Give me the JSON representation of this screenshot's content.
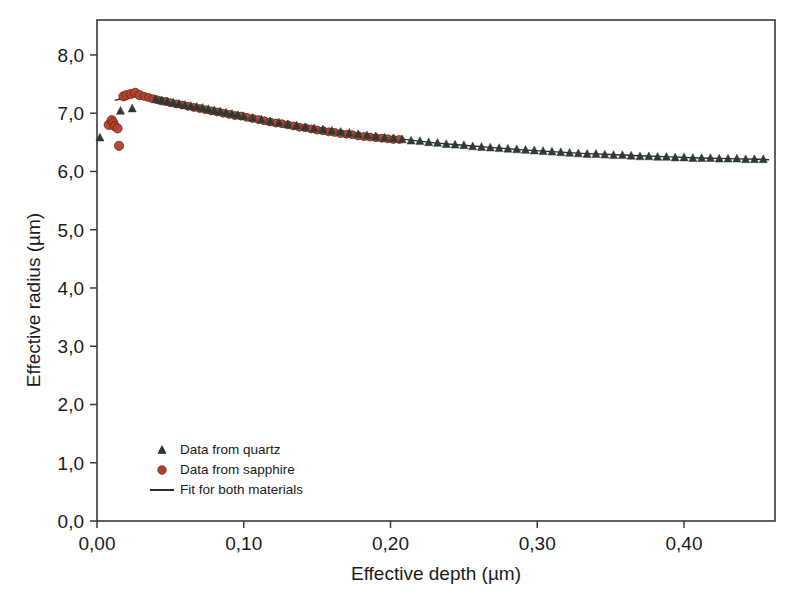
{
  "figure": {
    "background_color": "#ffffff",
    "frame_color": "#3a3a3a"
  },
  "chart_data": {
    "type": "scatter",
    "title": "",
    "xlabel": "Effective depth (µm)",
    "ylabel": "Effective radius (µm)",
    "xlim": [
      0.0,
      0.462
    ],
    "ylim": [
      0.0,
      8.6
    ],
    "xticks": [
      0.0,
      0.1,
      0.2,
      0.3,
      0.4
    ],
    "xtick_labels": [
      "0,00",
      "0,10",
      "0,20",
      "0,30",
      "0,40"
    ],
    "yticks": [
      0.0,
      1.0,
      2.0,
      3.0,
      4.0,
      5.0,
      6.0,
      7.0,
      8.0
    ],
    "ytick_labels": [
      "0,0",
      "1,0",
      "2,0",
      "3,0",
      "4,0",
      "5,0",
      "6,0",
      "7,0",
      "8,0"
    ],
    "grid": false,
    "legend_position": "lower-left",
    "decimal_separator": ",",
    "series": [
      {
        "name": "Data from quartz",
        "marker": "triangle",
        "color": "#2f3a32",
        "points": [
          [
            0.002,
            6.58
          ],
          [
            0.016,
            7.04
          ],
          [
            0.024,
            7.08
          ],
          [
            0.04,
            7.24
          ],
          [
            0.044,
            7.22
          ],
          [
            0.048,
            7.2
          ],
          [
            0.052,
            7.18
          ],
          [
            0.056,
            7.16
          ],
          [
            0.06,
            7.14
          ],
          [
            0.064,
            7.12
          ],
          [
            0.068,
            7.11
          ],
          [
            0.072,
            7.09
          ],
          [
            0.076,
            7.07
          ],
          [
            0.08,
            7.05
          ],
          [
            0.084,
            7.03
          ],
          [
            0.088,
            7.01
          ],
          [
            0.092,
            6.99
          ],
          [
            0.096,
            6.97
          ],
          [
            0.1,
            6.95
          ],
          [
            0.106,
            6.92
          ],
          [
            0.112,
            6.89
          ],
          [
            0.118,
            6.86
          ],
          [
            0.124,
            6.84
          ],
          [
            0.13,
            6.81
          ],
          [
            0.136,
            6.79
          ],
          [
            0.142,
            6.76
          ],
          [
            0.148,
            6.74
          ],
          [
            0.154,
            6.72
          ],
          [
            0.16,
            6.7
          ],
          [
            0.166,
            6.68
          ],
          [
            0.172,
            6.66
          ],
          [
            0.178,
            6.64
          ],
          [
            0.184,
            6.62
          ],
          [
            0.19,
            6.6
          ],
          [
            0.196,
            6.58
          ],
          [
            0.202,
            6.57
          ],
          [
            0.208,
            6.55
          ],
          [
            0.214,
            6.53
          ],
          [
            0.22,
            6.52
          ],
          [
            0.226,
            6.5
          ],
          [
            0.232,
            6.49
          ],
          [
            0.238,
            6.47
          ],
          [
            0.244,
            6.46
          ],
          [
            0.25,
            6.45
          ],
          [
            0.256,
            6.43
          ],
          [
            0.262,
            6.42
          ],
          [
            0.268,
            6.41
          ],
          [
            0.274,
            6.4
          ],
          [
            0.28,
            6.39
          ],
          [
            0.286,
            6.38
          ],
          [
            0.292,
            6.37
          ],
          [
            0.298,
            6.36
          ],
          [
            0.304,
            6.35
          ],
          [
            0.31,
            6.34
          ],
          [
            0.316,
            6.33
          ],
          [
            0.322,
            6.32
          ],
          [
            0.328,
            6.31
          ],
          [
            0.334,
            6.3
          ],
          [
            0.34,
            6.3
          ],
          [
            0.346,
            6.29
          ],
          [
            0.352,
            6.28
          ],
          [
            0.358,
            6.28
          ],
          [
            0.364,
            6.27
          ],
          [
            0.37,
            6.26
          ],
          [
            0.376,
            6.26
          ],
          [
            0.382,
            6.25
          ],
          [
            0.388,
            6.25
          ],
          [
            0.394,
            6.24
          ],
          [
            0.4,
            6.24
          ],
          [
            0.406,
            6.23
          ],
          [
            0.412,
            6.23
          ],
          [
            0.418,
            6.23
          ],
          [
            0.424,
            6.22
          ],
          [
            0.43,
            6.22
          ],
          [
            0.436,
            6.22
          ],
          [
            0.442,
            6.21
          ],
          [
            0.448,
            6.21
          ],
          [
            0.454,
            6.21
          ]
        ]
      },
      {
        "name": "Data from sapphire",
        "marker": "circle",
        "color": "#b1402c",
        "points": [
          [
            0.008,
            6.8
          ],
          [
            0.01,
            6.88
          ],
          [
            0.011,
            6.84
          ],
          [
            0.012,
            6.78
          ],
          [
            0.014,
            6.74
          ],
          [
            0.015,
            6.44
          ],
          [
            0.018,
            7.29
          ],
          [
            0.02,
            7.31
          ],
          [
            0.023,
            7.33
          ],
          [
            0.026,
            7.35
          ],
          [
            0.029,
            7.31
          ],
          [
            0.032,
            7.29
          ],
          [
            0.035,
            7.27
          ],
          [
            0.038,
            7.25
          ],
          [
            0.041,
            7.23
          ],
          [
            0.044,
            7.21
          ],
          [
            0.047,
            7.2
          ],
          [
            0.05,
            7.18
          ],
          [
            0.054,
            7.16
          ],
          [
            0.058,
            7.14
          ],
          [
            0.062,
            7.12
          ],
          [
            0.066,
            7.1
          ],
          [
            0.07,
            7.08
          ],
          [
            0.074,
            7.06
          ],
          [
            0.078,
            7.04
          ],
          [
            0.082,
            7.02
          ],
          [
            0.086,
            7.0
          ],
          [
            0.09,
            6.98
          ],
          [
            0.094,
            6.96
          ],
          [
            0.098,
            6.95
          ],
          [
            0.102,
            6.93
          ],
          [
            0.106,
            6.91
          ],
          [
            0.11,
            6.89
          ],
          [
            0.114,
            6.87
          ],
          [
            0.118,
            6.85
          ],
          [
            0.122,
            6.83
          ],
          [
            0.126,
            6.82
          ],
          [
            0.13,
            6.8
          ],
          [
            0.134,
            6.78
          ],
          [
            0.138,
            6.76
          ],
          [
            0.142,
            6.75
          ],
          [
            0.146,
            6.73
          ],
          [
            0.15,
            6.71
          ],
          [
            0.154,
            6.7
          ],
          [
            0.158,
            6.68
          ],
          [
            0.162,
            6.67
          ],
          [
            0.166,
            6.65
          ],
          [
            0.17,
            6.64
          ],
          [
            0.174,
            6.63
          ],
          [
            0.178,
            6.61
          ],
          [
            0.182,
            6.6
          ],
          [
            0.186,
            6.59
          ],
          [
            0.19,
            6.58
          ],
          [
            0.194,
            6.57
          ],
          [
            0.198,
            6.56
          ],
          [
            0.202,
            6.55
          ],
          [
            0.206,
            6.55
          ]
        ]
      },
      {
        "name": "Fit for both materials",
        "marker": "line",
        "color": "#2b2b2b",
        "points": [
          [
            0.012,
            7.22
          ],
          [
            0.02,
            7.27
          ],
          [
            0.028,
            7.3
          ],
          [
            0.036,
            7.28
          ],
          [
            0.05,
            7.2
          ],
          [
            0.07,
            7.09
          ],
          [
            0.09,
            6.99
          ],
          [
            0.11,
            6.9
          ],
          [
            0.13,
            6.81
          ],
          [
            0.15,
            6.73
          ],
          [
            0.17,
            6.66
          ],
          [
            0.19,
            6.6
          ],
          [
            0.21,
            6.55
          ],
          [
            0.23,
            6.49
          ],
          [
            0.25,
            6.45
          ],
          [
            0.27,
            6.41
          ],
          [
            0.29,
            6.37
          ],
          [
            0.31,
            6.34
          ],
          [
            0.33,
            6.31
          ],
          [
            0.35,
            6.29
          ],
          [
            0.37,
            6.27
          ],
          [
            0.39,
            6.25
          ],
          [
            0.41,
            6.23
          ],
          [
            0.43,
            6.22
          ],
          [
            0.45,
            6.21
          ],
          [
            0.458,
            6.2
          ]
        ]
      }
    ]
  },
  "legend": {
    "entries": [
      {
        "label": "Data from quartz",
        "marker": "triangle",
        "color": "#2f3a32"
      },
      {
        "label": "Data from sapphire",
        "marker": "circle",
        "color": "#b1402c"
      },
      {
        "label": "Fit for both materials",
        "marker": "line",
        "color": "#2b2b2b"
      }
    ]
  }
}
